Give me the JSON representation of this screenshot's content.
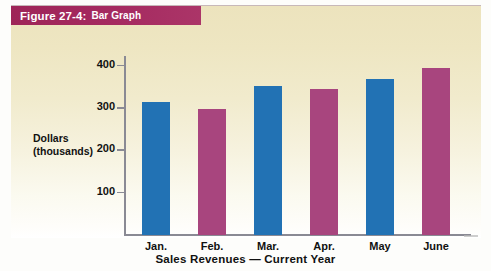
{
  "figure": {
    "number_label": "Figure 27-4:",
    "title": "Bar Graph"
  },
  "axes": {
    "y_title_line1": "Dollars",
    "y_title_line2": "(thousands)",
    "x_title": "Sales Revenues — Current Year",
    "y_ticks": [
      "100",
      "200",
      "300",
      "400"
    ]
  },
  "colors": {
    "banner_magenta": "#a52a60",
    "bar_blue": "#2272b4",
    "bar_magenta": "#a8457e",
    "panel_cream": "#ece3bd",
    "axis_gray": "#8a8a94"
  },
  "chart_data": {
    "type": "bar",
    "title": "Bar Graph",
    "xlabel": "Sales Revenues — Current Year",
    "ylabel": "Dollars (thousands)",
    "categories": [
      "Jan.",
      "Feb.",
      "Mar.",
      "Apr.",
      "May",
      "June"
    ],
    "values": [
      315,
      297,
      352,
      345,
      370,
      395
    ],
    "bar_colors": [
      "#2272b4",
      "#a8457e",
      "#2272b4",
      "#a8457e",
      "#2272b4",
      "#a8457e"
    ],
    "ylim": [
      0,
      420
    ],
    "yticks": [
      100,
      200,
      300,
      400
    ],
    "grid": false,
    "legend": "none"
  }
}
